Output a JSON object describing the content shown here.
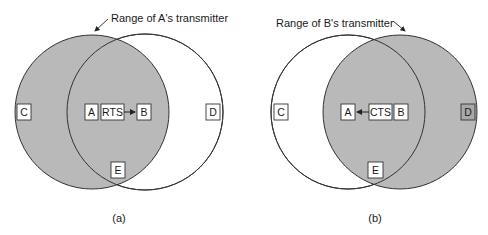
{
  "colors": {
    "range_fill": "#b9b9b9",
    "stroke": "#333333",
    "box_fill": "#ffffff",
    "background": "#ffffff"
  },
  "panels": [
    {
      "id": "a",
      "caption": "(a)",
      "annotation": "Range of A's transmitter",
      "shaded_range": "A",
      "message": "RTS",
      "message_direction": "A-to-B",
      "nodes": {
        "C": "C",
        "A": "A",
        "B": "B",
        "D": "D",
        "E": "E"
      }
    },
    {
      "id": "b",
      "caption": "(b)",
      "annotation": "Range of B's transmitter",
      "shaded_range": "B",
      "message": "CTS",
      "message_direction": "B-to-A",
      "nodes": {
        "C": "C",
        "A": "A",
        "B": "B",
        "D": "D",
        "E": "E"
      }
    }
  ]
}
